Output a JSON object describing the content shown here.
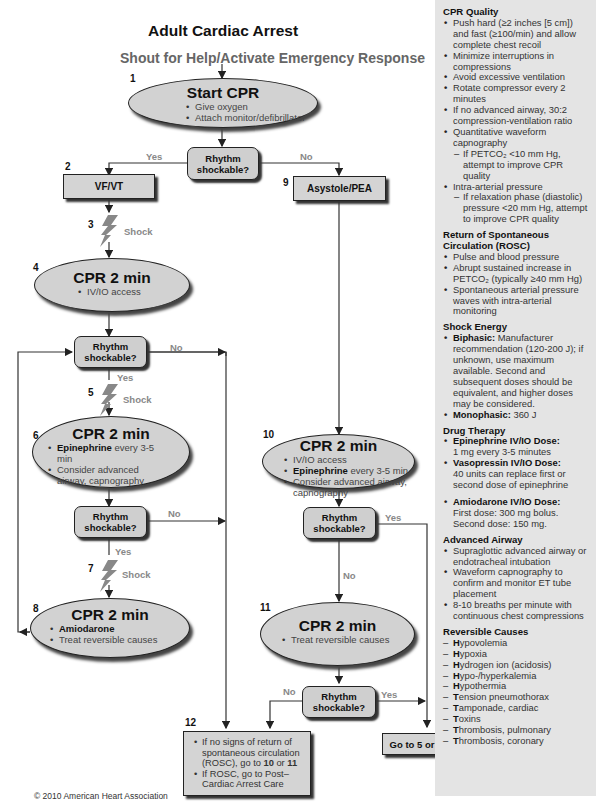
{
  "header": {
    "title": "Adult Cardiac Arrest",
    "subtitle": "Shout for Help/Activate Emergency Response"
  },
  "flow": {
    "step1": {
      "num": "1",
      "title": "Start CPR",
      "items": [
        "Give oxygen",
        "Attach monitor/defibrillator"
      ]
    },
    "decision1": {
      "label": "Rhythm shockable?",
      "yes": "Yes",
      "no": "No"
    },
    "step2": {
      "num": "2",
      "label": "VF/VT"
    },
    "step3": {
      "num": "3",
      "label": "Shock"
    },
    "step4": {
      "num": "4",
      "title": "CPR 2 min",
      "items": [
        "IV/IO access"
      ]
    },
    "decision2": {
      "label": "Rhythm shockable?",
      "yes": "Yes",
      "no": "No"
    },
    "step5": {
      "num": "5",
      "label": "Shock"
    },
    "step6": {
      "num": "6",
      "title": "CPR 2 min",
      "item1_bold": "Epinephrine",
      "item1_rest": " every 3-5 min",
      "item2": "Consider advanced airway, capnography"
    },
    "decision3": {
      "label": "Rhythm shockable?",
      "yes": "Yes",
      "no": "No"
    },
    "step7": {
      "num": "7",
      "label": "Shock"
    },
    "step8": {
      "num": "8",
      "title": "CPR 2 min",
      "item1_bold": "Amiodarone",
      "item2": "Treat reversible causes"
    },
    "step9": {
      "num": "9",
      "label": "Asystole/PEA"
    },
    "step10": {
      "num": "10",
      "title": "CPR 2 min",
      "item1": "IV/IO access",
      "item2_bold": "Epinephrine",
      "item2_rest": " every 3-5 min",
      "item3": "Consider advanced airway, capnography"
    },
    "decision4": {
      "label": "Rhythm shockable?",
      "yes": "Yes",
      "no": "No"
    },
    "step11": {
      "num": "11",
      "title": "CPR 2 min",
      "items": [
        "Treat reversible causes"
      ]
    },
    "decision5": {
      "label": "Rhythm shockable?",
      "yes": "Yes",
      "no": "No"
    },
    "step12": {
      "num": "12",
      "item1_a": "If no signs of return of spontaneous circulation (ROSC), go to ",
      "item1_b": "10",
      "item1_c": " or ",
      "item1_d": "11",
      "item2": "If ROSC, go to Post–Cardiac Arrest Care"
    },
    "goto": {
      "label": "Go to 5 or 7"
    }
  },
  "sidebar": {
    "cpr_quality": {
      "title": "CPR Quality",
      "items": [
        "Push hard (≥2 inches [5 cm]) and fast (≥100/min) and allow complete chest recoil",
        "Minimize interruptions in compressions",
        "Avoid excessive ventilation",
        "Rotate compressor every 2 minutes",
        "If no advanced airway, 30:2 compression-ventilation ratio",
        "Quantitative waveform capnography",
        "Intra-arterial pressure"
      ],
      "sub_capno": "If PETCO₂ <10 mm Hg, attempt to improve CPR quality",
      "sub_arterial": "If relaxation phase (diastolic) pressure <20 mm Hg, attempt to improve CPR quality"
    },
    "rosc": {
      "title": "Return of Spontaneous Circulation (ROSC)",
      "items": [
        "Pulse and blood pressure",
        "Abrupt sustained increase in PETCO₂ (typically ≥40 mm Hg)",
        "Spontaneous arterial pressure waves with intra-arterial monitoring"
      ]
    },
    "shock_energy": {
      "title": "Shock Energy",
      "biphasic_label": "Biphasic:",
      "biphasic_text": " Manufacturer recommendation (120-200 J); if unknown, use maximum available. Second and subsequent doses should be equivalent, and higher doses may be considered.",
      "monophasic_label": "Monophasic:",
      "monophasic_text": " 360 J"
    },
    "drug_therapy": {
      "title": "Drug Therapy",
      "epi_label": "Epinephrine IV/IO Dose:",
      "epi_text": "1 mg every 3-5 minutes",
      "vaso_label": "Vasopressin IV/IO Dose:",
      "vaso_text": "40 units can replace first or second dose of epinephrine",
      "amio_label": "Amiodarone IV/IO Dose:",
      "amio_text": "First dose: 300 mg bolus. Second dose: 150 mg."
    },
    "airway": {
      "title": "Advanced Airway",
      "items": [
        "Supraglottic advanced airway or endotracheal intubation",
        "Waveform capnography to confirm and monitor ET tube placement",
        "8-10 breaths per minute with continuous chest compressions"
      ]
    },
    "reversible": {
      "title": "Reversible Causes",
      "items": [
        {
          "b": "H",
          "r": "ypovolemia"
        },
        {
          "b": "H",
          "r": "ypoxia"
        },
        {
          "b": "H",
          "r": "ydrogen ion (acidosis)"
        },
        {
          "b": "H",
          "r": "ypo-/hyperkalemia"
        },
        {
          "b": "H",
          "r": "ypothermia"
        },
        {
          "b": "T",
          "r": "ension pneumothorax"
        },
        {
          "b": "T",
          "r": "amponade, cardiac"
        },
        {
          "b": "T",
          "r": "oxins"
        },
        {
          "b": "T",
          "r": "hrombosis, pulmonary"
        },
        {
          "b": "T",
          "r": "hrombosis, coronary"
        }
      ]
    }
  },
  "footer": {
    "copyright": "© 2010 American Heart Association"
  },
  "colors": {
    "fill": "#d2d2d2",
    "sidebar_bg": "#e4e4e4",
    "label_gray": "#888888"
  }
}
